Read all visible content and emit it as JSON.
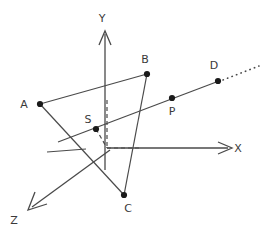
{
  "figure": {
    "width": 274,
    "height": 236,
    "background": "#ffffff",
    "stroke_color": "#4a4a4a",
    "label_color": "#3a3a3a",
    "point_color": "#1a1a1a"
  },
  "axes": [
    {
      "name": "y-axis",
      "label": "Y",
      "label_x": 102,
      "label_y": 22,
      "x1": 105,
      "y1": 170,
      "x2": 105,
      "y2": 31,
      "arrow": true,
      "style": "solid"
    },
    {
      "name": "x-axis",
      "label": "X",
      "label_x": 238,
      "label_y": 152,
      "x1": 107,
      "y1": 148,
      "x2": 231,
      "y2": 148,
      "arrow": true,
      "style": "solid"
    },
    {
      "name": "z-axis",
      "label": "Z",
      "label_x": 14,
      "label_y": 224,
      "x1": 110,
      "y1": 150,
      "x2": 29,
      "y2": 209,
      "arrow": true,
      "style": "solid"
    }
  ],
  "axis_stub": {
    "name": "x-axis-negative-stub",
    "x1": 47,
    "y1": 152,
    "x2": 86,
    "y2": 149
  },
  "points": [
    {
      "id": "A",
      "label": "A",
      "x": 40,
      "y": 104,
      "label_x": 24,
      "label_y": 108
    },
    {
      "id": "B",
      "label": "B",
      "x": 147,
      "y": 74,
      "label_x": 143,
      "label_y": 63
    },
    {
      "id": "C",
      "label": "C",
      "x": 124,
      "y": 195,
      "label_x": 126,
      "label_y": 211
    },
    {
      "id": "S",
      "label": "S",
      "x": 96,
      "y": 129,
      "label_x": 88,
      "label_y": 122
    },
    {
      "id": "P",
      "label": "P",
      "x": 172,
      "y": 98,
      "label_x": 169,
      "label_y": 114
    },
    {
      "id": "D",
      "label": "D",
      "x": 218,
      "y": 81,
      "label_x": 212,
      "label_y": 69
    }
  ],
  "segments": [
    {
      "name": "segment-A-B",
      "x1": 40,
      "y1": 104,
      "x2": 147,
      "y2": 74,
      "style": "solid"
    },
    {
      "name": "segment-A-C",
      "x1": 40,
      "y1": 104,
      "x2": 124,
      "y2": 195,
      "style": "solid"
    },
    {
      "name": "segment-B-C",
      "x1": 147,
      "y1": 74,
      "x2": 124,
      "y2": 195,
      "style": "solid"
    },
    {
      "name": "line-S-P-D",
      "x1": 58,
      "y1": 142,
      "x2": 218,
      "y2": 81,
      "style": "solid"
    }
  ],
  "dotted_ray": {
    "name": "ray-beyond-D",
    "x1": 222,
    "y1": 80,
    "x2": 259,
    "y2": 66,
    "style": "dotted"
  },
  "dashed_guides": [
    {
      "name": "dashed-S-to-origin",
      "x1": 96,
      "y1": 129,
      "x2": 107,
      "y2": 148
    },
    {
      "name": "dashed-vertical-projection",
      "x1": 107,
      "y1": 100,
      "x2": 107,
      "y2": 148
    },
    {
      "name": "dashed-horizontal-projection",
      "x1": 107,
      "y1": 148,
      "x2": 142,
      "y2": 148
    }
  ]
}
